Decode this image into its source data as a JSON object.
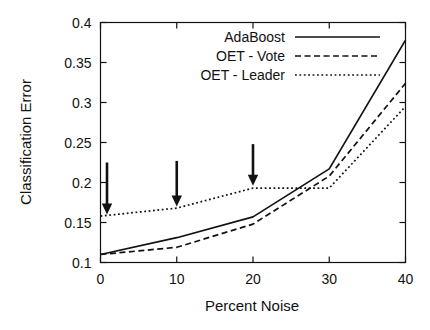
{
  "chart_data": {
    "type": "line",
    "title": "",
    "xlabel": "Percent Noise",
    "ylabel": "Classification Error",
    "xlim": [
      0,
      40
    ],
    "ylim": [
      0.1,
      0.4
    ],
    "xticks": [
      "0",
      "10",
      "20",
      "30",
      "40"
    ],
    "xtick_values": [
      0,
      10,
      20,
      30,
      40
    ],
    "yticks": [
      "0.1",
      "0.15",
      "0.2",
      "0.25",
      "0.3",
      "0.35",
      "0.4"
    ],
    "ytick_values": [
      0.1,
      0.15,
      0.2,
      0.25,
      0.3,
      0.35,
      0.4
    ],
    "grid": false,
    "legend_position": "top-center",
    "x": [
      0,
      10,
      20,
      30,
      40
    ],
    "series": [
      {
        "name": "AdaBoost",
        "style": "solid",
        "values": [
          0.11,
          0.131,
          0.157,
          0.217,
          0.378
        ]
      },
      {
        "name": "OET - Vote",
        "style": "dashed",
        "values": [
          0.11,
          0.119,
          0.148,
          0.208,
          0.324
        ]
      },
      {
        "name": "OET - Leader",
        "style": "dotted",
        "values": [
          0.158,
          0.168,
          0.193,
          0.193,
          0.295
        ]
      }
    ],
    "annotations": [
      {
        "kind": "arrow",
        "label": "",
        "x": 0,
        "y_tip": 0.16,
        "y_tail": 0.225
      },
      {
        "kind": "arrow",
        "label": "",
        "x": 10,
        "y_tip": 0.17,
        "y_tail": 0.227
      },
      {
        "kind": "arrow",
        "label": "",
        "x": 20,
        "y_tip": 0.196,
        "y_tail": 0.248
      }
    ]
  },
  "colors": {
    "ink": "#111111",
    "background": "#ffffff"
  }
}
